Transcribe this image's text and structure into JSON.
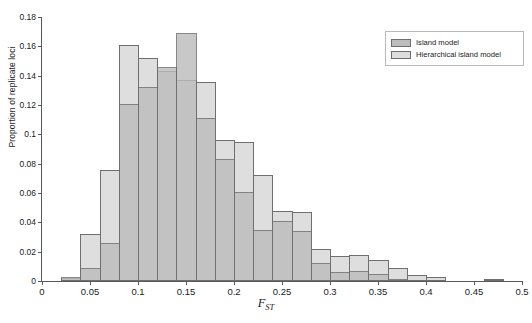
{
  "chart_data": {
    "type": "bar",
    "subtype": "overlaid-histogram",
    "title": "",
    "xlabel": "F_ST",
    "xlabel_base": "F",
    "xlabel_sub": "ST",
    "ylabel": "Proportion of replicate loci",
    "xlim": [
      0,
      0.5
    ],
    "ylim": [
      0,
      0.18
    ],
    "bin_width": 0.02,
    "grid": false,
    "legend_position": "top-right",
    "x_tick_labels": [
      "0",
      "0.05",
      "0.1",
      "0.15",
      "0.2",
      "0.25",
      "0.3",
      "0.35",
      "0.4",
      "0.45",
      "0.5"
    ],
    "x_tick_values": [
      0,
      0.05,
      0.1,
      0.15,
      0.2,
      0.25,
      0.3,
      0.35,
      0.4,
      0.45,
      0.5
    ],
    "y_tick_labels": [
      "0",
      "0.02",
      "0.04",
      "0.06",
      "0.08",
      "0.1",
      "0.12",
      "0.14",
      "0.16",
      "0.18"
    ],
    "y_tick_values": [
      0,
      0.02,
      0.04,
      0.06,
      0.08,
      0.1,
      0.12,
      0.14,
      0.16,
      0.18
    ],
    "bin_starts": [
      0.0,
      0.02,
      0.04,
      0.06,
      0.08,
      0.1,
      0.12,
      0.14,
      0.16,
      0.18,
      0.2,
      0.22,
      0.24,
      0.26,
      0.28,
      0.3,
      0.32,
      0.34,
      0.36,
      0.38,
      0.4,
      0.42,
      0.44,
      0.46,
      0.48
    ],
    "colors": {
      "island": "#bdbdbd",
      "hierarchical": "#dedede",
      "bar_outline": "#6e6f71",
      "axis": "#58595b",
      "background": "#ffffff"
    },
    "series": [
      {
        "name": "Island model",
        "color": "#bdbdbd",
        "values": [
          0.0,
          0.003,
          0.009,
          0.026,
          0.121,
          0.132,
          0.146,
          0.169,
          0.111,
          0.083,
          0.061,
          0.035,
          0.041,
          0.034,
          0.012,
          0.006,
          0.007,
          0.005,
          0.001,
          0.0,
          0.0,
          0.0,
          0.0,
          0.001,
          0.0
        ]
      },
      {
        "name": "Hierarchical island model",
        "color": "#dedede",
        "values": [
          0.0,
          0.002,
          0.032,
          0.076,
          0.161,
          0.152,
          0.143,
          0.137,
          0.136,
          0.096,
          0.095,
          0.072,
          0.048,
          0.047,
          0.022,
          0.017,
          0.018,
          0.014,
          0.009,
          0.004,
          0.003,
          0.0,
          0.0,
          0.001,
          0.0
        ]
      }
    ]
  },
  "legend": {
    "items": [
      {
        "label": "Island model",
        "key": "island"
      },
      {
        "label": "Hierarchical island model",
        "key": "hier"
      }
    ]
  }
}
